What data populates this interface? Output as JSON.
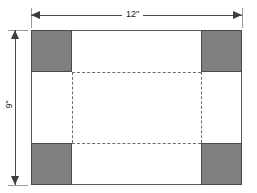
{
  "figure": {
    "sheet": {
      "width_label": "12\"",
      "height_label": "9\""
    },
    "colors": {
      "corner_fill": "#7f7f7f",
      "sheet_fill": "#ffffff",
      "outline": "#5a5a5a",
      "fold_line": "#6e6e6e",
      "dimension_line": "#4a4a4a",
      "background": "#ffffff"
    },
    "corners": [
      {
        "name": "top-left"
      },
      {
        "name": "top-right"
      },
      {
        "name": "bottom-left"
      },
      {
        "name": "bottom-right"
      }
    ],
    "fold_lines": [
      {
        "name": "fold-line-top"
      },
      {
        "name": "fold-line-bottom"
      },
      {
        "name": "fold-line-left"
      },
      {
        "name": "fold-line-right"
      }
    ]
  }
}
